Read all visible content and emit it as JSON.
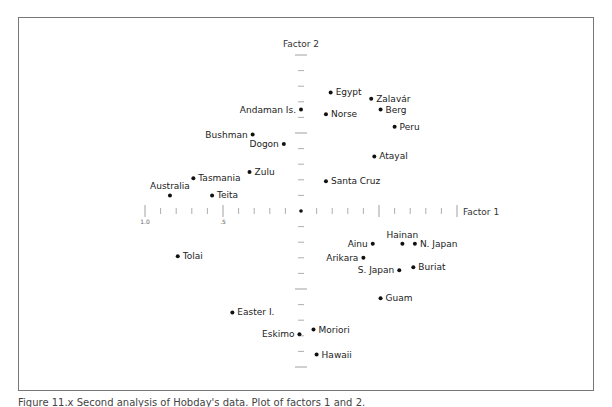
{
  "figure": {
    "caption": "Figure 11.x  Second analysis of Hobday's data.  Plot of factors 1 and 2."
  },
  "chart_data": {
    "type": "scatter",
    "title": "",
    "xlabel": "Factor 1",
    "ylabel": "Factor 2",
    "xlim": [
      -1.0,
      1.0
    ],
    "ylim": [
      -1.0,
      1.0
    ],
    "grid": false,
    "legend": "none",
    "x_tick_labels": [
      {
        "value": -1.0,
        "label": "1.0"
      },
      {
        "value": -0.5,
        "label": ".5"
      }
    ],
    "tick_interval": 0.1,
    "points": [
      {
        "label": "Egypt",
        "x": 0.19,
        "y": 0.76,
        "anchor": "right"
      },
      {
        "label": "Zalavár",
        "x": 0.45,
        "y": 0.72,
        "anchor": "right"
      },
      {
        "label": "Berg",
        "x": 0.51,
        "y": 0.65,
        "anchor": "right"
      },
      {
        "label": "Norse",
        "x": 0.16,
        "y": 0.62,
        "anchor": "right"
      },
      {
        "label": "Andaman Is.",
        "x": 0.0,
        "y": 0.65,
        "anchor": "left"
      },
      {
        "label": "Peru",
        "x": 0.6,
        "y": 0.54,
        "anchor": "right"
      },
      {
        "label": "Bushman",
        "x": -0.31,
        "y": 0.49,
        "anchor": "left"
      },
      {
        "label": "Dogon",
        "x": -0.11,
        "y": 0.43,
        "anchor": "left"
      },
      {
        "label": "Atayal",
        "x": 0.47,
        "y": 0.35,
        "anchor": "right"
      },
      {
        "label": "Zulu",
        "x": -0.33,
        "y": 0.25,
        "anchor": "right"
      },
      {
        "label": "Tasmania",
        "x": -0.69,
        "y": 0.21,
        "anchor": "right"
      },
      {
        "label": "Santa Cruz",
        "x": 0.16,
        "y": 0.19,
        "anchor": "right"
      },
      {
        "label": "Australia",
        "x": -0.84,
        "y": 0.1,
        "anchor": "above"
      },
      {
        "label": "Teita",
        "x": -0.57,
        "y": 0.1,
        "anchor": "right"
      },
      {
        "label": "Hainan",
        "x": 0.65,
        "y": -0.21,
        "anchor": "above"
      },
      {
        "label": "Ainu",
        "x": 0.46,
        "y": -0.21,
        "anchor": "left"
      },
      {
        "label": "N. Japan",
        "x": 0.73,
        "y": -0.21,
        "anchor": "right"
      },
      {
        "label": "Arikara",
        "x": 0.4,
        "y": -0.3,
        "anchor": "left"
      },
      {
        "label": "S. Japan",
        "x": 0.63,
        "y": -0.38,
        "anchor": "left"
      },
      {
        "label": "Buriat",
        "x": 0.72,
        "y": -0.36,
        "anchor": "right"
      },
      {
        "label": "Tolai",
        "x": -0.79,
        "y": -0.29,
        "anchor": "right"
      },
      {
        "label": "Guam",
        "x": 0.51,
        "y": -0.56,
        "anchor": "right"
      },
      {
        "label": "Easter I.",
        "x": -0.44,
        "y": -0.65,
        "anchor": "right"
      },
      {
        "label": "Moriori",
        "x": 0.08,
        "y": -0.76,
        "anchor": "right"
      },
      {
        "label": "Eskimo",
        "x": -0.01,
        "y": -0.79,
        "anchor": "left"
      },
      {
        "label": "Hawaii",
        "x": 0.1,
        "y": -0.92,
        "anchor": "right"
      }
    ]
  }
}
